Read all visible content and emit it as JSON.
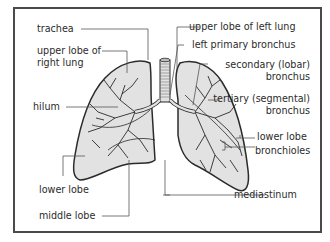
{
  "diagram": {
    "colors": {
      "frame": "#4a4a4a",
      "lung_fill": "#e2e2e2",
      "outline": "#2b2b2b",
      "leader_line": "#555555",
      "text": "#2b2b2b"
    },
    "labels": {
      "trachea": "trachea",
      "upper_lobe_right_1": "upper lobe of",
      "upper_lobe_right_2": "right lung",
      "hilum": "hilum",
      "lower_lobe_right": "lower lobe",
      "middle_lobe": "middle lobe",
      "upper_lobe_left": "upper lobe of left lung",
      "left_primary_bronchus": "left primary bronchus",
      "secondary_1": "secondary (lobar)",
      "secondary_2": "bronchus",
      "tertiary_1": "tertiary (segmental)",
      "tertiary_2": "bronchus",
      "lower_lobe_left": "lower lobe",
      "bronchioles": "bronchioles",
      "mediastinum": "mediastinum"
    }
  }
}
